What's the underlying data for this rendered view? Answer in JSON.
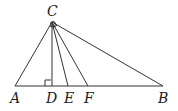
{
  "diagram": {
    "type": "geometry-triangle",
    "points": {
      "A": {
        "label": "A",
        "x": 15,
        "y": 86
      },
      "B": {
        "label": "B",
        "x": 163,
        "y": 86
      },
      "C": {
        "label": "C",
        "x": 52,
        "y": 22
      },
      "D": {
        "label": "D",
        "x": 52,
        "y": 86
      },
      "E": {
        "label": "E",
        "x": 68,
        "y": 86
      },
      "F": {
        "label": "F",
        "x": 88,
        "y": 86
      }
    },
    "segments": [
      "CA",
      "CB",
      "AB",
      "CD",
      "CE",
      "CF"
    ],
    "annotations": [
      "right angle at D",
      "angle arcs at C"
    ]
  }
}
